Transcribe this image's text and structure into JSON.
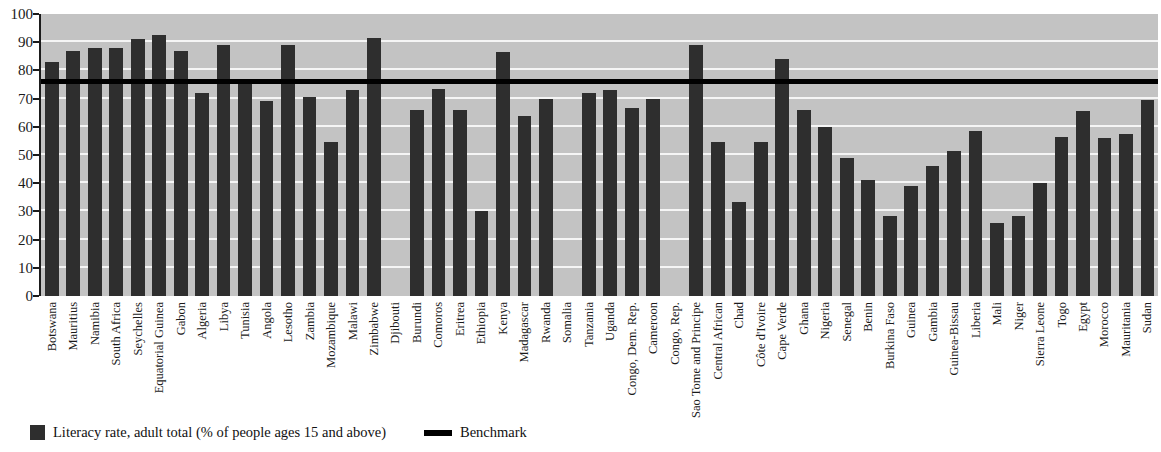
{
  "chart_data": {
    "type": "bar",
    "title": "",
    "xlabel": "",
    "ylabel": "",
    "ylim": [
      0,
      100
    ],
    "ytick_values": [
      100,
      90,
      80,
      70,
      60,
      50,
      40,
      30,
      20,
      10,
      0
    ],
    "grid": true,
    "legend_position": "bottom-left",
    "benchmark_value": 76,
    "series": [
      {
        "name": "Literacy rate, adult total (% of people ages 15 and above)",
        "color": "#2e2e2e",
        "values": [
          83,
          87,
          88,
          88,
          91,
          92.5,
          87,
          72,
          89,
          77,
          69,
          89,
          70.5,
          54.5,
          73,
          91.5,
          null,
          66,
          73.5,
          66,
          30,
          86.5,
          64,
          70,
          null,
          72,
          73,
          66.5,
          70,
          null,
          89,
          54.5,
          33.5,
          54.5,
          84,
          66,
          60,
          49,
          41,
          28.5,
          39,
          46,
          51.5,
          58.5,
          26,
          28.5,
          40,
          56.5,
          65.5,
          56,
          57.5,
          69.5
        ]
      },
      {
        "name": "Benchmark",
        "color": "#000000",
        "type": "hline",
        "value": 76
      }
    ],
    "categories": [
      "Botswana",
      "Mauritius",
      "Namibia",
      "South Africa",
      "Seychelles",
      "Equatorial Guinea",
      "Gabon",
      "Algeria",
      "Libya",
      "Tunisia",
      "Angola",
      "Lesotho",
      "Zambia",
      "Mozambique",
      "Malawi",
      "Zimbabwe",
      "Djibouti",
      "Burundi",
      "Comoros",
      "Eritrea",
      "Ethiopia",
      "Kenya",
      "Madagascar",
      "Rwanda",
      "Somalia",
      "Tanzania",
      "Uganda",
      "Congo, Dem. Rep.",
      "Cameroon",
      "Congo, Rep.",
      "Sao Tome and Principe",
      "Central African",
      "Chad",
      "Côte d'Ivoire",
      "Cape Verde",
      "Ghana",
      "Nigeria",
      "Senegal",
      "Benin",
      "Burkina Faso",
      "Guinea",
      "Gambia",
      "Guinea-Bissau",
      "Liberia",
      "Mali",
      "Niger",
      "Sierra Leone",
      "Togo",
      "Egypt",
      "Morocco",
      "Mauritania",
      "Sudan"
    ]
  },
  "legend": {
    "bar_label": "Literacy rate, adult total (% of people ages 15 and above)",
    "line_label": "Benchmark"
  },
  "colors": {
    "bar": "#2e2e2e",
    "benchmark": "#000000",
    "plot_background": "#c3c3c3",
    "gridline": "#f5f5f5",
    "axis": "#1b1b1b"
  }
}
